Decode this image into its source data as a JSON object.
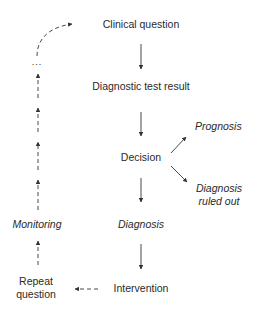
{
  "diagram": {
    "nodes": {
      "clinical_question": "Clinical question",
      "diagnostic_test_result": "Diagnostic test result",
      "decision": "Decision",
      "prognosis": "Prognosis",
      "diagnosis_ruled_out_1": "Diagnosis",
      "diagnosis_ruled_out_2": "ruled out",
      "diagnosis": "Diagnosis",
      "intervention": "Intervention",
      "monitoring": "Monitoring",
      "repeat_question_1": "Repeat",
      "repeat_question_2": "question",
      "ellipsis": "..."
    },
    "edges": [
      {
        "from": "Clinical question",
        "to": "Diagnostic test result",
        "style": "solid"
      },
      {
        "from": "Diagnostic test result",
        "to": "Decision",
        "style": "solid"
      },
      {
        "from": "Decision",
        "to": "Prognosis",
        "style": "solid"
      },
      {
        "from": "Decision",
        "to": "Diagnosis ruled out",
        "style": "solid"
      },
      {
        "from": "Decision",
        "to": "Diagnosis",
        "style": "solid"
      },
      {
        "from": "Diagnosis",
        "to": "Intervention",
        "style": "solid"
      },
      {
        "from": "Intervention",
        "to": "Repeat question",
        "style": "dashed"
      },
      {
        "from": "Repeat question",
        "to": "Monitoring",
        "style": "dashed"
      },
      {
        "from": "Monitoring",
        "to": "...",
        "style": "dashed"
      },
      {
        "from": "...",
        "to": "Clinical question",
        "style": "dashed-curved"
      }
    ],
    "colors": {
      "line": "#333333",
      "text": "#2a2a2a",
      "background": "#ffffff"
    }
  }
}
